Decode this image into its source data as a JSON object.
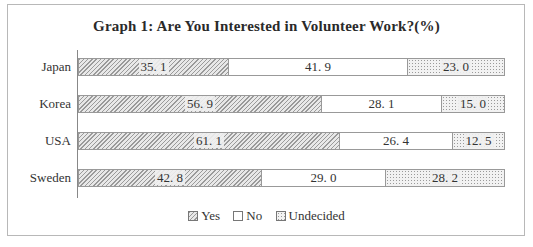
{
  "chart_data": {
    "type": "bar",
    "orientation": "horizontal",
    "stacked": true,
    "title": "Graph 1: Are You Interested in Volunteer Work?(%)",
    "categories": [
      "Japan",
      "Korea",
      "USA",
      "Sweden"
    ],
    "series": [
      {
        "name": "Yes",
        "pattern": "diagonal-hatch",
        "values": [
          35.1,
          56.9,
          61.1,
          42.8
        ]
      },
      {
        "name": "No",
        "pattern": "white",
        "values": [
          41.9,
          28.1,
          26.4,
          29.0
        ]
      },
      {
        "name": "Undecided",
        "pattern": "dotted",
        "values": [
          23.0,
          15.0,
          12.5,
          28.2
        ]
      }
    ],
    "value_labels": [
      [
        "35. 1",
        "41. 9",
        "23. 0"
      ],
      [
        "56. 9",
        "28. 1",
        "15. 0"
      ],
      [
        "61. 1",
        "26. 4",
        "12. 5"
      ],
      [
        "42. 8",
        "29. 0",
        "28. 2"
      ]
    ],
    "xlabel": "",
    "ylabel": "",
    "xlim": [
      0,
      100
    ],
    "grid": false,
    "legend_position": "bottom"
  },
  "title": "Graph 1: Are You Interested in Volunteer Work?(%)",
  "legend": {
    "yes": "Yes",
    "no": "No",
    "undecided": "Undecided"
  }
}
